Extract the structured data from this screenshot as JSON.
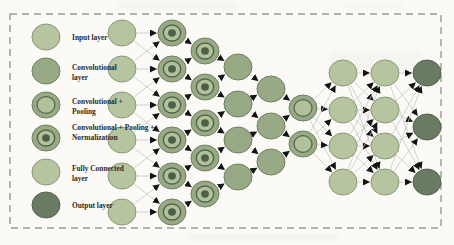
{
  "legend": {
    "items": [
      {
        "type": "input",
        "label_lines": [
          "Input layer"
        ]
      },
      {
        "type": "conv",
        "label_lines": [
          "Convolutional",
          "layer"
        ]
      },
      {
        "type": "conv_pool",
        "label_lines": [
          "Convolutional +",
          "Pooling"
        ]
      },
      {
        "type": "conv_pool_norm",
        "label_lines": [
          "Convolutional + Pooling +",
          "Normalization"
        ]
      },
      {
        "type": "fc",
        "label_lines": [
          "Fully Connected",
          "layer"
        ]
      },
      {
        "type": "output",
        "label_lines": [
          "Output layer"
        ]
      }
    ]
  },
  "network": {
    "columns": [
      {
        "layer_type": "input",
        "x": 122,
        "ys": [
          33,
          69,
          105,
          140,
          176,
          212
        ]
      },
      {
        "layer_type": "conv_pool_norm",
        "x": 172,
        "ys": [
          33,
          69,
          105,
          140,
          176,
          212
        ]
      },
      {
        "layer_type": "conv_pool_norm",
        "x": 205,
        "ys": [
          51,
          87,
          123,
          158,
          194
        ]
      },
      {
        "layer_type": "conv",
        "x": 238,
        "ys": [
          67,
          104,
          140,
          177
        ]
      },
      {
        "layer_type": "conv",
        "x": 271,
        "ys": [
          89,
          126,
          162
        ]
      },
      {
        "layer_type": "conv_pool",
        "x": 303,
        "ys": [
          108,
          144
        ]
      },
      {
        "layer_type": "fc",
        "x": 343,
        "ys": [
          73,
          110,
          146,
          182
        ]
      },
      {
        "layer_type": "fc",
        "x": 385,
        "ys": [
          73,
          110,
          146,
          182
        ]
      },
      {
        "layer_type": "output",
        "x": 427,
        "ys": [
          73,
          127,
          182
        ]
      }
    ],
    "gaps": [
      {
        "mode": "local"
      },
      {
        "mode": "local"
      },
      {
        "mode": "local"
      },
      {
        "mode": "local"
      },
      {
        "mode": "local"
      },
      {
        "mode": "full"
      },
      {
        "mode": "full"
      },
      {
        "mode": "full"
      }
    ]
  },
  "colors": {
    "node_light": "#b6c5a0",
    "node_light_stroke": "#8a997a",
    "node_medium": "#97a985",
    "node_medium_stroke": "#6f8160",
    "node_dark": "#6a7b64",
    "node_dark_stroke": "#55644d",
    "inner_light": "#b1c19b",
    "ring_stroke": "#54644c",
    "bullseye_core": "#4e5e48",
    "line": "#c6c6c1",
    "arrow": "#141414",
    "border": "#9a9a97",
    "text": "#2b2a26",
    "background": "#fbfaf7"
  }
}
